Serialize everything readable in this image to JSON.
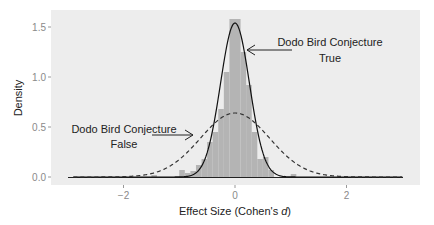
{
  "chart_data": {
    "type": "bar",
    "title": "",
    "xlabel": "Effect Size (Cohen's d)",
    "xlabel_prefix": "Effect Size (Cohen's ",
    "xlabel_italic": "d",
    "xlabel_suffix": ")",
    "ylabel": "Density",
    "xlim": [
      -3.05,
      3.3
    ],
    "ylim": [
      -0.07,
      1.67
    ],
    "x_ticks": [
      -2,
      0,
      2
    ],
    "x_tick_labels": [
      "−2",
      "0",
      "2"
    ],
    "y_ticks": [
      0.0,
      0.5,
      1.0,
      1.5
    ],
    "y_tick_labels": [
      "0.0",
      "0.5",
      "1.0",
      "1.5"
    ],
    "grid": false,
    "histogram": {
      "bin_width": 0.1,
      "bins": [
        {
          "x0": -1.5,
          "x1": -1.4,
          "density": 0.02
        },
        {
          "x0": -1.0,
          "x1": -0.9,
          "density": 0.07
        },
        {
          "x0": -0.9,
          "x1": -0.8,
          "density": 0.04
        },
        {
          "x0": -0.8,
          "x1": -0.7,
          "density": 0.06
        },
        {
          "x0": -0.7,
          "x1": -0.6,
          "density": 0.12
        },
        {
          "x0": -0.6,
          "x1": -0.5,
          "density": 0.18
        },
        {
          "x0": -0.5,
          "x1": -0.4,
          "density": 0.35
        },
        {
          "x0": -0.4,
          "x1": -0.3,
          "density": 0.45
        },
        {
          "x0": -0.3,
          "x1": -0.2,
          "density": 0.68
        },
        {
          "x0": -0.2,
          "x1": -0.1,
          "density": 1.05
        },
        {
          "x0": -0.1,
          "x1": 0.0,
          "density": 1.58
        },
        {
          "x0": 0.0,
          "x1": 0.1,
          "density": 1.58
        },
        {
          "x0": 0.1,
          "x1": 0.2,
          "density": 1.25
        },
        {
          "x0": 0.2,
          "x1": 0.3,
          "density": 0.92
        },
        {
          "x0": 0.3,
          "x1": 0.4,
          "density": 0.45
        },
        {
          "x0": 0.4,
          "x1": 0.5,
          "density": 0.18
        },
        {
          "x0": 0.5,
          "x1": 0.6,
          "density": 0.2
        },
        {
          "x0": 0.6,
          "x1": 0.7,
          "density": 0.07
        },
        {
          "x0": 1.0,
          "x1": 1.1,
          "density": 0.03
        }
      ],
      "color": "#b4b4b4"
    },
    "series": [
      {
        "name": "Dodo Bird Conjecture True",
        "type": "line",
        "style": "solid",
        "distribution": "normal",
        "mean": 0.0,
        "sd": 0.26,
        "peak": 1.54,
        "x_range": [
          -2.9,
          3.0
        ],
        "color": "#111111"
      },
      {
        "name": "Dodo Bird Conjecture False",
        "type": "line",
        "style": "dashed",
        "distribution": "normal",
        "mean": 0.0,
        "sd": 0.62,
        "peak": 0.64,
        "x_range": [
          -2.9,
          3.0
        ],
        "color": "#333333"
      }
    ],
    "annotations": [
      {
        "line1": "Dodo Bird Conjecture",
        "line2": "True",
        "arrow_to": [
          0.27,
          1.25
        ]
      },
      {
        "line1": "Dodo Bird Conjecture",
        "line2": "False",
        "arrow_to": [
          -0.78,
          0.44
        ]
      }
    ],
    "panel_background": "#ebebeb"
  }
}
